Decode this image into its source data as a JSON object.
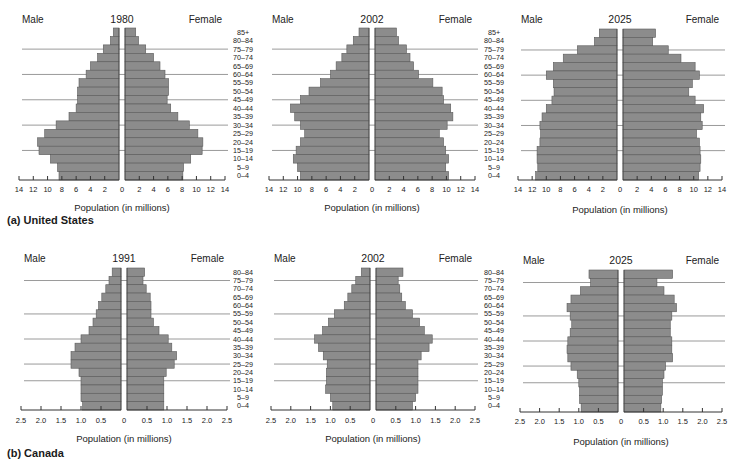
{
  "figure": {
    "panels": [
      {
        "id": "us",
        "label": "(a) United States"
      },
      {
        "id": "canada",
        "label": "(b) Canada"
      }
    ]
  },
  "colors": {
    "bar": "#8c8c8c",
    "bar_edge": "#5a5a5a",
    "gridline": "#9a9a9a",
    "axis": "#333333",
    "text": "#1a1a1a"
  },
  "chart_data": [
    {
      "type": "bar",
      "orientation": "population-pyramid",
      "panel": "(a) United States",
      "title": "1980",
      "left_label": "Male",
      "right_label": "Female",
      "xlabel": "Population (in millions)",
      "xlim": [
        14,
        14
      ],
      "xticks_left": [
        "14",
        "12",
        "10",
        "8",
        "6",
        "4",
        "2"
      ],
      "xticks_center": "0",
      "xticks_right": [
        "2",
        "4",
        "6",
        "8",
        "10",
        "12",
        "14"
      ],
      "categories": [
        "85+",
        "80–84",
        "75–79",
        "70–74",
        "65–69",
        "60–64",
        "55–59",
        "50–54",
        "45–49",
        "40–44",
        "35–39",
        "30–34",
        "25–29",
        "20–24",
        "15–19",
        "10–14",
        "5–9",
        "0–4"
      ],
      "series": [
        {
          "name": "Male",
          "values": [
            0.8,
            1.2,
            2.2,
            3.0,
            4.0,
            4.6,
            5.6,
            5.8,
            5.8,
            6.0,
            7.0,
            8.8,
            10.4,
            11.4,
            11.2,
            9.6,
            8.6,
            8.4
          ]
        },
        {
          "name": "Female",
          "values": [
            1.5,
            1.9,
            2.9,
            4.0,
            4.9,
            5.6,
            6.1,
            6.1,
            5.9,
            6.4,
            7.4,
            9.0,
            10.2,
            10.9,
            10.8,
            9.2,
            8.2,
            8.1
          ]
        }
      ],
      "gridlines_at": [
        "75–79",
        "60–64",
        "45–49",
        "30–34",
        "15–19"
      ],
      "age_labels_shown": true
    },
    {
      "type": "bar",
      "orientation": "population-pyramid",
      "panel": "(a) United States",
      "title": "2002",
      "left_label": "Male",
      "right_label": "Female",
      "xlabel": "Population (in millions)",
      "xlim": [
        14,
        14
      ],
      "xticks_left": [
        "14",
        "12",
        "10",
        "8",
        "6",
        "4",
        "2"
      ],
      "xticks_center": "0",
      "xticks_right": [
        "2",
        "4",
        "6",
        "8",
        "10",
        "12",
        "14"
      ],
      "categories": [
        "85+",
        "80–84",
        "75–79",
        "70–74",
        "65–69",
        "60–64",
        "55–59",
        "50–54",
        "45–49",
        "40–44",
        "35–39",
        "30–34",
        "25–29",
        "20–24",
        "15–19",
        "10–14",
        "5–9",
        "0–4"
      ],
      "series": [
        {
          "name": "Male",
          "values": [
            1.4,
            2.2,
            3.1,
            3.8,
            4.6,
            5.4,
            6.8,
            8.4,
            9.6,
            11.0,
            10.4,
            9.6,
            9.0,
            9.6,
            10.2,
            10.6,
            10.0,
            9.6
          ]
        },
        {
          "name": "Female",
          "values": [
            3.0,
            3.3,
            4.4,
            4.9,
            5.4,
            6.1,
            8.1,
            9.4,
            9.6,
            10.6,
            10.9,
            10.1,
            9.0,
            9.6,
            9.9,
            10.3,
            9.9,
            10.3
          ]
        }
      ],
      "gridlines_at": [
        "75–79",
        "60–64",
        "45–49",
        "30–34",
        "15–19"
      ],
      "age_labels_shown": true
    },
    {
      "type": "bar",
      "orientation": "population-pyramid",
      "panel": "(a) United States",
      "title": "2025",
      "left_label": "Male",
      "right_label": "Female",
      "xlabel": "Population (in millions)",
      "xlim": [
        14,
        14
      ],
      "xticks_left": [
        "14",
        "12",
        "10",
        "8",
        "6",
        "4",
        "2"
      ],
      "xticks_center": "0",
      "xticks_right": [
        "2",
        "4",
        "6",
        "8",
        "10",
        "12",
        "14"
      ],
      "categories": [
        "85+",
        "80–84",
        "75–79",
        "70–74",
        "65–69",
        "60–64",
        "55–59",
        "50–54",
        "45–49",
        "40–44",
        "35–39",
        "30–34",
        "25–29",
        "20–24",
        "15–19",
        "10–14",
        "5–9",
        "0–4"
      ],
      "series": [
        {
          "name": "Male",
          "values": [
            2.5,
            3.2,
            5.6,
            7.6,
            9.0,
            10.0,
            9.0,
            8.9,
            9.2,
            10.0,
            10.6,
            10.9,
            10.8,
            10.9,
            11.3,
            11.3,
            11.2,
            11.5
          ]
        },
        {
          "name": "Female",
          "values": [
            4.6,
            4.2,
            6.4,
            8.2,
            10.2,
            10.8,
            9.8,
            9.3,
            10.2,
            11.4,
            11.0,
            11.2,
            10.4,
            10.8,
            10.9,
            11.0,
            10.9,
            10.7
          ]
        }
      ],
      "gridlines_at": [
        "75–79",
        "60–64",
        "45–49",
        "30–34",
        "15–19"
      ],
      "age_labels_shown": false
    },
    {
      "type": "bar",
      "orientation": "population-pyramid",
      "panel": "(b) Canada",
      "title": "1991",
      "left_label": "Male",
      "right_label": "Female",
      "xlabel": "Population (in millions)",
      "xlim": [
        2.5,
        2.5
      ],
      "xticks_left": [
        "2.5",
        "2.0",
        "1.5",
        "1.0",
        "0.5"
      ],
      "xticks_center": "0",
      "xticks_right": [
        "0.5",
        "1.0",
        "1.5",
        "2.0",
        "2.5"
      ],
      "categories": [
        "80–84",
        "75–79",
        "70–74",
        "65–69",
        "60–64",
        "55–59",
        "50–54",
        "45–49",
        "40–44",
        "35–39",
        "30–34",
        "25–29",
        "20–24",
        "15–19",
        "10–14",
        "5–9",
        "0–4"
      ],
      "series": [
        {
          "name": "Male",
          "values": [
            0.22,
            0.3,
            0.38,
            0.48,
            0.56,
            0.62,
            0.7,
            0.8,
            1.0,
            1.15,
            1.25,
            1.25,
            1.05,
            1.0,
            1.0,
            1.0,
            0.96
          ]
        },
        {
          "name": "Female",
          "values": [
            0.44,
            0.4,
            0.48,
            0.58,
            0.6,
            0.6,
            0.66,
            0.8,
            1.03,
            1.12,
            1.24,
            1.18,
            0.98,
            0.92,
            0.92,
            0.92,
            0.92
          ]
        }
      ],
      "gridlines_at": [
        "75–79",
        "55–59",
        "40–44",
        "25–29",
        "15–19"
      ],
      "age_labels_shown": true
    },
    {
      "type": "bar",
      "orientation": "population-pyramid",
      "panel": "(b) Canada",
      "title": "2002",
      "left_label": "Male",
      "right_label": "Female",
      "xlabel": "Population (in millions)",
      "xlim": [
        2.5,
        2.5
      ],
      "xticks_left": [
        "2.5",
        "2.0",
        "1.5",
        "1.0",
        "0.5"
      ],
      "xticks_center": "0",
      "xticks_right": [
        "0.5",
        "1.0",
        "1.5",
        "2.0",
        "2.5"
      ],
      "categories": [
        "80–84",
        "75–79",
        "70–74",
        "65–69",
        "60–64",
        "55–59",
        "50–54",
        "45–49",
        "40–44",
        "35–39",
        "30–34",
        "25–29",
        "20–24",
        "15–19",
        "10–14",
        "5–9",
        "0–4"
      ],
      "series": [
        {
          "name": "Male",
          "values": [
            0.22,
            0.36,
            0.46,
            0.56,
            0.65,
            0.9,
            1.05,
            1.2,
            1.4,
            1.3,
            1.18,
            1.08,
            1.1,
            1.1,
            1.12,
            1.0,
            0.94
          ]
        },
        {
          "name": "Female",
          "values": [
            0.68,
            0.56,
            0.6,
            0.65,
            0.74,
            0.92,
            1.1,
            1.22,
            1.42,
            1.34,
            1.14,
            1.06,
            1.06,
            1.06,
            1.06,
            1.0,
            0.92
          ]
        }
      ],
      "gridlines_at": [
        "75–79",
        "55–59",
        "40–44",
        "25–29",
        "15–19"
      ],
      "age_labels_shown": true
    },
    {
      "type": "bar",
      "orientation": "population-pyramid",
      "panel": "(b) Canada",
      "title": "2025",
      "left_label": "Male",
      "right_label": "Female",
      "xlabel": "Population (in millions)",
      "xlim": [
        2.5,
        2.5
      ],
      "xticks_left": [
        "2.5",
        "2.0",
        "1.5",
        "1.0",
        "0.5"
      ],
      "xticks_center": "0",
      "xticks_right": [
        "0.5",
        "1.0",
        "1.5",
        "2.0",
        "2.5"
      ],
      "categories": [
        "80–84",
        "75–79",
        "70–74",
        "65–69",
        "60–64",
        "55–59",
        "50–54",
        "45–49",
        "40–44",
        "35–39",
        "30–34",
        "25–29",
        "20–24",
        "15–19",
        "10–14",
        "5–9",
        "0–4"
      ],
      "series": [
        {
          "name": "Male",
          "values": [
            0.74,
            0.7,
            0.96,
            1.2,
            1.3,
            1.22,
            1.18,
            1.22,
            1.28,
            1.3,
            1.28,
            1.2,
            1.04,
            1.0,
            0.98,
            0.98,
            0.94
          ]
        },
        {
          "name": "Female",
          "values": [
            1.24,
            0.84,
            1.02,
            1.28,
            1.34,
            1.22,
            1.18,
            1.18,
            1.22,
            1.22,
            1.24,
            1.06,
            1.02,
            0.98,
            0.98,
            0.96,
            0.94
          ]
        }
      ],
      "gridlines_at": [
        "75–79",
        "55–59",
        "40–44",
        "25–29",
        "15–19"
      ],
      "age_labels_shown": false
    }
  ]
}
